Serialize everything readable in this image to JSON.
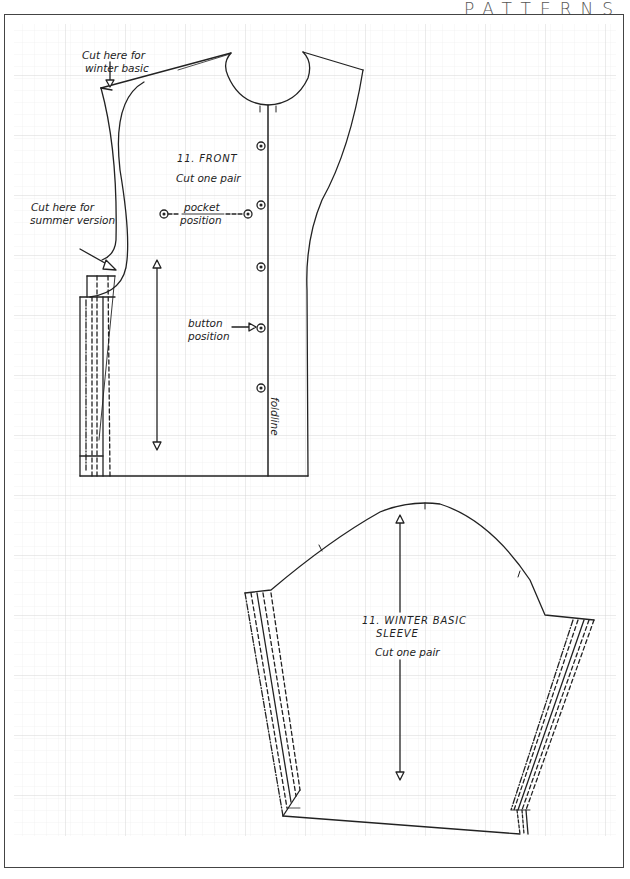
{
  "header": {
    "title": "PATTERNS"
  },
  "front_piece": {
    "title": "11. FRONT",
    "instruction": "Cut one pair",
    "labels": {
      "cut_winter": [
        "Cut here for",
        "winter basic"
      ],
      "cut_summer": [
        "Cut here for",
        "summer version"
      ],
      "pocket": [
        "pocket",
        "position"
      ],
      "button": [
        "button",
        "position"
      ],
      "foldline": "foldline"
    },
    "button_count": 5
  },
  "sleeve_piece": {
    "title_line1": "11. WINTER BASIC",
    "title_line2": "SLEEVE",
    "instruction": "Cut one pair"
  },
  "colors": {
    "ink": "#222222",
    "grid_major": "#cfcfcf",
    "grid_minor": "#ececec",
    "border": "#444444"
  }
}
